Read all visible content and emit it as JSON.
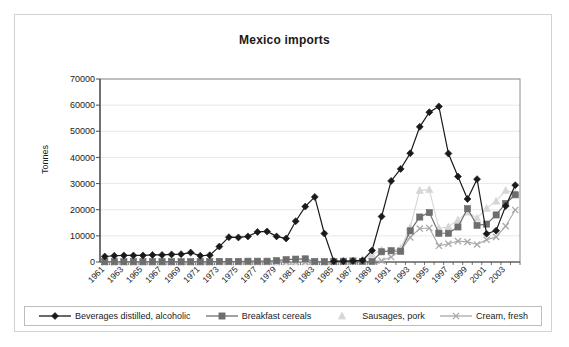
{
  "chart_data": {
    "type": "line",
    "title": "Mexico imports",
    "xlabel": "",
    "ylabel": "Tonnes",
    "ylim": [
      0,
      70000
    ],
    "ytick_values": [
      0,
      10000,
      20000,
      30000,
      40000,
      50000,
      60000,
      70000
    ],
    "ytick_labels": [
      "0",
      "10000",
      "20000",
      "30000",
      "40000",
      "50000",
      "60000",
      "70000"
    ],
    "grid": true,
    "legend_position": "bottom",
    "x": [
      1961,
      1962,
      1963,
      1964,
      1965,
      1966,
      1967,
      1968,
      1969,
      1970,
      1971,
      1972,
      1973,
      1974,
      1975,
      1976,
      1977,
      1978,
      1979,
      1980,
      1981,
      1982,
      1983,
      1984,
      1985,
      1986,
      1987,
      1988,
      1989,
      1990,
      1991,
      1992,
      1993,
      1994,
      1995,
      1996,
      1997,
      1998,
      1999,
      2000,
      2001,
      2002,
      2003,
      2004
    ],
    "xtick_labels": [
      "1961",
      "1963",
      "1965",
      "1967",
      "1969",
      "1971",
      "1973",
      "1975",
      "1977",
      "1979",
      "1981",
      "1983",
      "1985",
      "1987",
      "1989",
      "1991",
      "1993",
      "1995",
      "1997",
      "1999",
      "2001",
      "2003"
    ],
    "series": [
      {
        "name": "Beverages distilled, alcoholic",
        "color": "#1a1a1a",
        "marker": "diamond",
        "values": [
          2100,
          2400,
          2500,
          2500,
          2500,
          2700,
          2700,
          2900,
          3000,
          3600,
          2400,
          2600,
          5900,
          9500,
          9400,
          9800,
          11500,
          11700,
          9800,
          9000,
          15600,
          21200,
          24900,
          10900,
          300,
          300,
          400,
          600,
          4400,
          17400,
          31000,
          35600,
          41600,
          51700,
          57300,
          59500,
          41500,
          32700,
          24100,
          31700,
          10800,
          12000,
          21400,
          29400
        ]
      },
      {
        "name": "Breakfast cereals",
        "color": "#6e6e6e",
        "marker": "square",
        "values": [
          100,
          100,
          100,
          100,
          100,
          100,
          100,
          100,
          100,
          100,
          100,
          100,
          200,
          200,
          200,
          300,
          300,
          300,
          500,
          900,
          1100,
          1200,
          200,
          100,
          200,
          300,
          400,
          200,
          200,
          3900,
          4300,
          4100,
          11900,
          17200,
          18900,
          11000,
          11000,
          13400,
          20400,
          14000,
          14500,
          18000,
          22400,
          25700
        ]
      },
      {
        "name": "Sausages, pork",
        "color": "#d6d6d6",
        "marker": "triangle",
        "values": [
          50,
          50,
          50,
          50,
          50,
          50,
          50,
          50,
          50,
          50,
          50,
          50,
          50,
          50,
          50,
          50,
          50,
          50,
          50,
          100,
          100,
          100,
          100,
          100,
          100,
          200,
          300,
          1000,
          2900,
          4600,
          4400,
          5200,
          13300,
          27400,
          27700,
          12900,
          13500,
          16100,
          19100,
          16800,
          20500,
          23300,
          27400,
          26300
        ]
      },
      {
        "name": "Cream, fresh",
        "color": "#a8a8a8",
        "marker": "cross",
        "values": [
          50,
          50,
          50,
          50,
          50,
          50,
          50,
          50,
          50,
          50,
          50,
          50,
          50,
          50,
          50,
          50,
          50,
          50,
          50,
          50,
          50,
          50,
          50,
          50,
          50,
          50,
          100,
          200,
          300,
          500,
          1900,
          4400,
          9400,
          12800,
          13000,
          6200,
          7000,
          8000,
          7700,
          6700,
          8500,
          9600,
          13700,
          19900
        ]
      }
    ]
  },
  "legend": {
    "items": [
      {
        "label": "Beverages distilled, alcoholic"
      },
      {
        "label": "Breakfast cereals"
      },
      {
        "label": "Sausages, pork"
      },
      {
        "label": "Cream, fresh"
      }
    ]
  }
}
